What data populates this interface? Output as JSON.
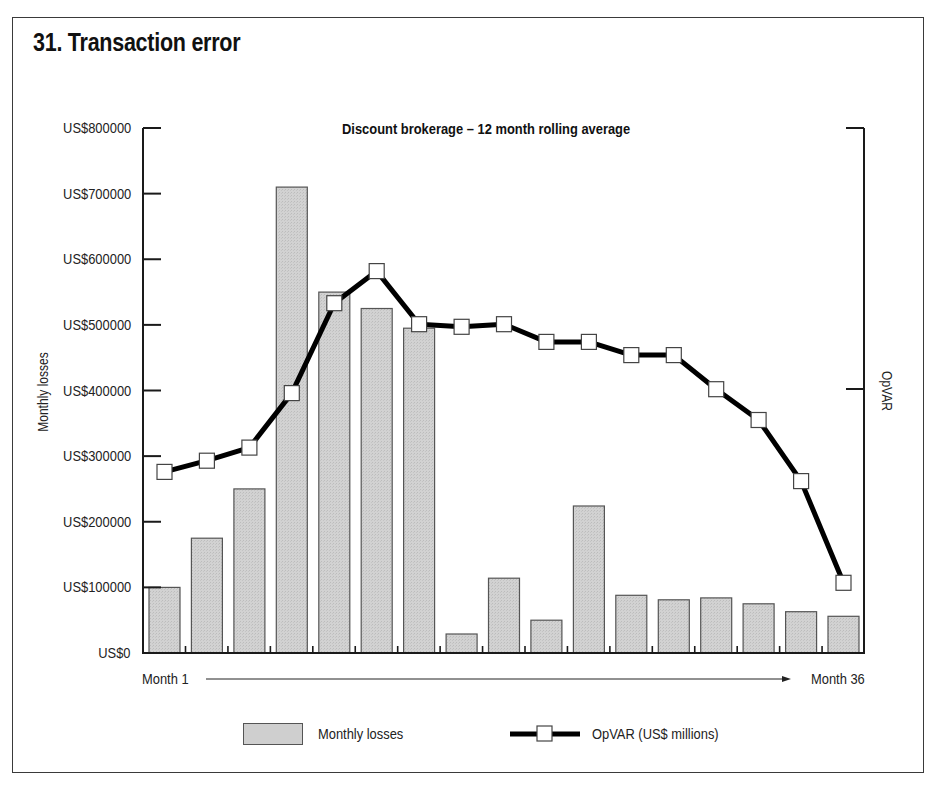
{
  "figure": {
    "title": "31. Transaction error",
    "subtitle": "Discount brokerage – 12 month rolling average",
    "left_axis_label": "Monthly losses",
    "right_axis_label": "OpVAR",
    "x_start_label": "Month 1",
    "x_end_label": "Month 36",
    "y_tick_labels": [
      "US$0",
      "US$100000",
      "US$200000",
      "US$300000",
      "US$400000",
      "US$500000",
      "US$600000",
      "US$700000",
      "US$800000"
    ],
    "legend": {
      "bars_label": "Monthly losses",
      "line_label": "OpVAR (US$ millions)"
    },
    "colors": {
      "bar_fill": "#cfcfcf",
      "bar_stroke": "#555555",
      "line": "#000000",
      "marker_fill": "#ffffff",
      "axis": "#1a1a1a"
    }
  },
  "chart_data": {
    "type": "bar",
    "title": "31. Transaction error",
    "subtitle": "Discount brokerage – 12 month rolling average",
    "xlabel": "Month 1 → Month 36",
    "ylabel": "Monthly losses",
    "ylabel_right": "OpVAR",
    "ylim": [
      0,
      800000
    ],
    "yticks": [
      0,
      100000,
      200000,
      300000,
      400000,
      500000,
      600000,
      700000,
      800000
    ],
    "grid": false,
    "legend_position": "bottom",
    "categories": [
      "1",
      "2",
      "3",
      "4",
      "5",
      "6",
      "7",
      "8",
      "9",
      "10",
      "11",
      "12",
      "13",
      "14",
      "15",
      "16",
      "17"
    ],
    "series": [
      {
        "name": "Monthly losses",
        "type": "bar",
        "axis": "left",
        "values": [
          100000,
          175000,
          250000,
          710000,
          550000,
          525000,
          495000,
          29000,
          114000,
          50000,
          224000,
          88000,
          81000,
          84000,
          75000,
          63000,
          56000
        ]
      },
      {
        "name": "OpVAR (US$ millions)",
        "type": "line",
        "axis": "right",
        "note": "right axis unlabeled; values expressed in left-axis-equivalent position",
        "values": [
          276000,
          293000,
          313000,
          396000,
          533000,
          582000,
          501000,
          497000,
          501000,
          474000,
          474000,
          454000,
          454000,
          402000,
          355000,
          262000,
          107000
        ]
      }
    ]
  }
}
